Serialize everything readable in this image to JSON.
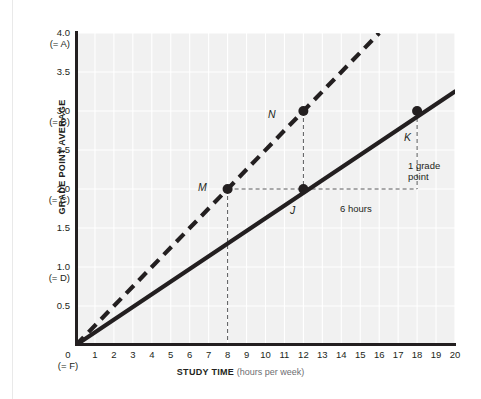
{
  "chart_data": {
    "type": "line",
    "title": "",
    "xlabel_bold": "STUDY TIME",
    "xlabel_note": "(hours per week)",
    "ylabel": "GRADE POINT AVERAGE",
    "xlim": [
      0,
      20.6
    ],
    "ylim": [
      0,
      4.25
    ],
    "grid": true,
    "legend": "none",
    "x_ticks": [
      1,
      2,
      3,
      4,
      5,
      6,
      7,
      8,
      9,
      10,
      11,
      12,
      13,
      14,
      15,
      16,
      17,
      18,
      19,
      20
    ],
    "x_origin_label": "0",
    "x_origin_sub": "(= F)",
    "y_ticks": [
      {
        "value": 4.0,
        "label": "4.0",
        "sub": "(= A)"
      },
      {
        "value": 3.5,
        "label": "3.5",
        "sub": ""
      },
      {
        "value": 3.0,
        "label": "3.0",
        "sub": "(= B)"
      },
      {
        "value": 2.5,
        "label": "2.5",
        "sub": ""
      },
      {
        "value": 2.0,
        "label": "2.0",
        "sub": "(= C)"
      },
      {
        "value": 1.5,
        "label": "1.5",
        "sub": ""
      },
      {
        "value": 1.0,
        "label": "1.0",
        "sub": "(= D)"
      },
      {
        "value": 0.5,
        "label": "0.5",
        "sub": ""
      }
    ],
    "series": [
      {
        "name": "dashed-line",
        "style": "dashed",
        "color": "#231f20",
        "x": [
          0,
          16
        ],
        "y": [
          0,
          4.0
        ]
      },
      {
        "name": "solid-line",
        "style": "solid",
        "color": "#231f20",
        "x": [
          0,
          20
        ],
        "y": [
          0,
          3.25
        ]
      }
    ],
    "points": [
      {
        "label": "M",
        "x": 8,
        "y": 2.0,
        "series": "dashed-line"
      },
      {
        "label": "N",
        "x": 12,
        "y": 3.0,
        "series": "dashed-line"
      },
      {
        "label": "J",
        "x": 12,
        "y": 2.0,
        "series": "solid-line"
      },
      {
        "label": "K",
        "x": 18,
        "y": 3.0,
        "series": "solid-line"
      }
    ],
    "annotations": [
      {
        "name": "run-label",
        "text": "6 hours"
      },
      {
        "name": "rise-label",
        "text": "1 grade point"
      }
    ],
    "colors": {
      "plot_background": "#f1f1f1",
      "gridline": "#ffffff",
      "axis": "#231f20",
      "text": "#231f20",
      "muted_text": "#6d6e71"
    }
  }
}
